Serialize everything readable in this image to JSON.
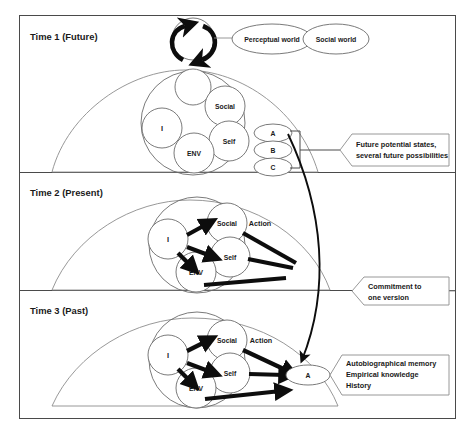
{
  "diagram": {
    "panels": [
      {
        "id": "time1",
        "title": "Time 1 (Future)"
      },
      {
        "id": "time2",
        "title": "Time 2 (Present)"
      },
      {
        "id": "time3",
        "title": "Time 3 (Past)"
      }
    ],
    "worlds": [
      {
        "label": "Perceptual world"
      },
      {
        "label": "Social world"
      }
    ],
    "core_nodes": {
      "i": "I",
      "social": "Social",
      "self": "Self",
      "env": "ENV"
    },
    "action_label": "Action",
    "future_states": [
      {
        "label": "A"
      },
      {
        "label": "B"
      },
      {
        "label": "C"
      }
    ],
    "committed_state": {
      "label": "A"
    },
    "callouts": [
      {
        "id": "future-potential",
        "lines": [
          "Future potential states,",
          "several future possibilities"
        ]
      },
      {
        "id": "commitment",
        "lines": [
          "Commitment to",
          "one version"
        ]
      },
      {
        "id": "autobiographical",
        "lines": [
          "Autobiographical memory",
          "Empirical knowledge",
          "History"
        ]
      }
    ],
    "colors": {
      "frame": "#4a4a4a",
      "hill_stroke": "#8c8c8c",
      "node_stroke": "#6b6b6b",
      "arrow": "#0d0d0d",
      "text": "#1a1a1a",
      "background": "#ffffff"
    }
  }
}
